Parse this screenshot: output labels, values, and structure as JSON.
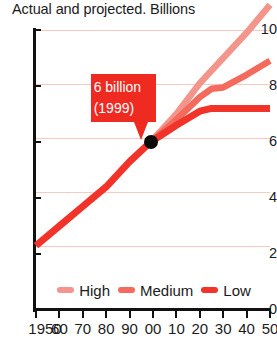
{
  "chart_data": {
    "type": "line",
    "title": "Actual and projected. Billions",
    "xlabel": "",
    "ylabel": "Billions",
    "ylim": [
      0,
      10
    ],
    "xlim": [
      1950,
      2050
    ],
    "grid": true,
    "legend_position": "bottom",
    "y_ticks": [
      "10",
      "8",
      "6",
      "4",
      "2",
      "0"
    ],
    "x_ticks": [
      "1950",
      "60",
      "70",
      "80",
      "90",
      "00",
      "10",
      "20",
      "30",
      "40",
      "50"
    ],
    "x_tick_years": [
      1950,
      1960,
      1970,
      1980,
      1990,
      2000,
      2010,
      2020,
      2030,
      2040,
      2050
    ],
    "annotation": {
      "label": "6 billion\n(1999)",
      "line1": "6 billion",
      "line2": "(1999)",
      "year": 1999,
      "value": 6.0
    },
    "colors": {
      "high": "#f4958b",
      "medium": "#f46a5c",
      "low": "#f2332a",
      "actual": "#f2332a",
      "gridline": "#f6c9c3",
      "axis": "#111111",
      "callout_bg": "#ef2a21",
      "callout_text": "#ffffff",
      "marker": "#0a0a0a"
    },
    "series": [
      {
        "name": "Actual",
        "x": [
          1950,
          1960,
          1970,
          1980,
          1990,
          1999
        ],
        "values": [
          2.3,
          3.0,
          3.7,
          4.4,
          5.3,
          6.0
        ]
      },
      {
        "name": "High",
        "x": [
          1999,
          2010,
          2020,
          2030,
          2040,
          2050
        ],
        "values": [
          6.0,
          7.0,
          8.1,
          9.0,
          9.9,
          10.9
        ]
      },
      {
        "name": "Medium",
        "x": [
          1999,
          2010,
          2020,
          2025,
          2030,
          2040,
          2050
        ],
        "values": [
          6.0,
          6.8,
          7.6,
          7.9,
          7.95,
          8.4,
          8.9
        ]
      },
      {
        "name": "Low",
        "x": [
          1999,
          2010,
          2020,
          2025,
          2030,
          2040,
          2050
        ],
        "values": [
          6.0,
          6.6,
          7.1,
          7.2,
          7.2,
          7.2,
          7.2
        ]
      }
    ]
  },
  "legend": {
    "items": [
      {
        "label": "High",
        "color": "#f4958b"
      },
      {
        "label": "Medium",
        "color": "#f46a5c"
      },
      {
        "label": "Low",
        "color": "#f2332a"
      }
    ]
  }
}
